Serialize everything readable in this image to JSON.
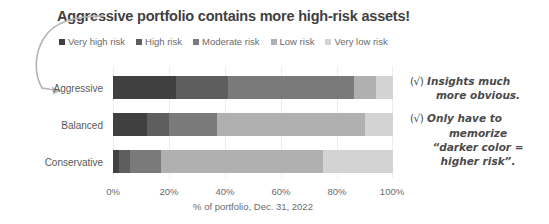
{
  "title": "Aggressive portfolio contains more high-risk assets!",
  "legend": {
    "items": [
      {
        "label": "Very high risk",
        "color": "#404040"
      },
      {
        "label": "High risk",
        "color": "#5e5e5e"
      },
      {
        "label": "Moderate risk",
        "color": "#7a7a7a"
      },
      {
        "label": "Low risk",
        "color": "#b0b0b0"
      },
      {
        "label": "Very low risk",
        "color": "#d3d3d3"
      }
    ]
  },
  "axis": {
    "title": "% of portfolio, Dec. 31, 2022",
    "ticks": [
      "0%",
      "20%",
      "40%",
      "60%",
      "80%",
      "100%"
    ]
  },
  "categories": [
    "Aggressive",
    "Balanced",
    "Conservative"
  ],
  "annotations": [
    {
      "check": "(√)",
      "lines": [
        "Insights much",
        "more obvious."
      ]
    },
    {
      "check": "(√)",
      "lines": [
        "Only have to",
        "memorize",
        "“darker color =",
        "higher risk”."
      ]
    }
  ],
  "chart_data": {
    "type": "bar",
    "orientation": "horizontal",
    "stacked": true,
    "stack_mode": "percent",
    "title": "Aggressive portfolio contains more high-risk assets!",
    "xlabel": "% of portfolio, Dec. 31, 2022",
    "ylabel": "",
    "xlim": [
      0,
      100
    ],
    "xticks": [
      0,
      20,
      40,
      60,
      80,
      100
    ],
    "xticklabels": [
      "0%",
      "20%",
      "40%",
      "60%",
      "80%",
      "100%"
    ],
    "grid": "vertical",
    "legend_position": "top",
    "categories": [
      "Aggressive",
      "Balanced",
      "Conservative"
    ],
    "series": [
      {
        "name": "Very high risk",
        "color": "#404040",
        "values": [
          22.5,
          12,
          2
        ]
      },
      {
        "name": "High risk",
        "color": "#5e5e5e",
        "values": [
          18.5,
          8,
          4
        ]
      },
      {
        "name": "Moderate risk",
        "color": "#7a7a7a",
        "values": [
          45,
          17,
          11
        ]
      },
      {
        "name": "Low risk",
        "color": "#b0b0b0",
        "values": [
          8,
          53,
          58
        ]
      },
      {
        "name": "Very low risk",
        "color": "#d3d3d3",
        "values": [
          6,
          10,
          25
        ]
      }
    ]
  }
}
